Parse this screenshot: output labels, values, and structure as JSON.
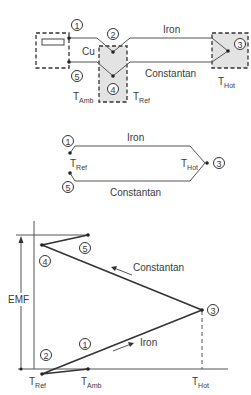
{
  "circuit": {
    "wire_top": "Iron",
    "wire_bottom": "Constantan",
    "copper_label": "Cu",
    "t_amb": {
      "main": "T",
      "sub": "Amb"
    },
    "t_ref": {
      "main": "T",
      "sub": "Ref"
    },
    "t_hot": {
      "main": "T",
      "sub": "Hot"
    },
    "nodes": [
      "1",
      "2",
      "3",
      "4",
      "5"
    ]
  },
  "simplified": {
    "wire_top": "Iron",
    "wire_bottom": "Constantan",
    "t_ref": {
      "main": "T",
      "sub": "Ref"
    },
    "t_hot": {
      "main": "T",
      "sub": "Hot"
    },
    "nodes": [
      "1",
      "3",
      "5"
    ]
  },
  "graph": {
    "y_label": "EMF",
    "constantan_label": "Constantan",
    "iron_label": "Iron",
    "x_ticks": [
      {
        "main": "T",
        "sub": "Ref"
      },
      {
        "main": "T",
        "sub": "Amb"
      },
      {
        "main": "T",
        "sub": "Hot"
      }
    ],
    "nodes": [
      "1",
      "2",
      "3",
      "4",
      "5"
    ]
  },
  "colors": {
    "zone_fill": "#e3e3e3",
    "line": "#333333"
  }
}
